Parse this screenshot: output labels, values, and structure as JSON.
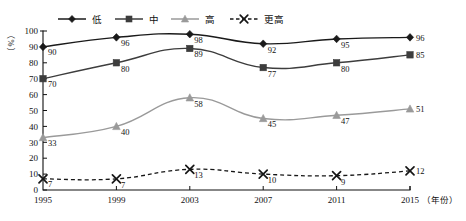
{
  "chart_data": {
    "type": "line",
    "title": "",
    "subtitle": "",
    "xlabel": "（年份）",
    "ylabel": "（%）",
    "x": [
      1995,
      1999,
      2003,
      2007,
      2011,
      2015
    ],
    "categories": [
      "1995",
      "1999",
      "2003",
      "2007",
      "2011",
      "2015"
    ],
    "xlim": [
      1995,
      2015
    ],
    "ylim": [
      0,
      100
    ],
    "yticks": [
      0,
      10,
      20,
      30,
      40,
      50,
      60,
      70,
      80,
      90,
      100
    ],
    "ytick_labels": [
      "0",
      "10",
      "20",
      "30",
      "40",
      "50",
      "60",
      "70",
      "80",
      "90",
      "100"
    ],
    "grid": false,
    "legend_position": "top-center",
    "series": [
      {
        "name": "低",
        "values": [
          90,
          96,
          98,
          92,
          95,
          96
        ],
        "color": "#1a1a1a",
        "marker": "diamond",
        "dash": "solid",
        "labels": [
          "90",
          "96",
          "98",
          "92",
          "95",
          "96"
        ]
      },
      {
        "name": "中",
        "values": [
          70,
          80,
          89,
          77,
          80,
          85
        ],
        "color": "#3d3d3d",
        "marker": "square",
        "dash": "solid",
        "labels": [
          "70",
          "80",
          "89",
          "77",
          "80",
          "85"
        ]
      },
      {
        "name": "高",
        "values": [
          33,
          40,
          58,
          45,
          47,
          51
        ],
        "color": "#9a9a9a",
        "marker": "triangle",
        "dash": "solid",
        "labels": [
          "33",
          "40",
          "58",
          "45",
          "47",
          "51"
        ]
      },
      {
        "name": "更高",
        "values": [
          7,
          7,
          13,
          10,
          9,
          12
        ],
        "color": "#161616",
        "marker": "cross",
        "dash": "dashed",
        "labels": [
          "7",
          "7",
          "13",
          "10",
          "9",
          "12"
        ]
      }
    ]
  },
  "legend": {
    "items": [
      {
        "label": "低"
      },
      {
        "label": "中"
      },
      {
        "label": "高"
      },
      {
        "label": "更高"
      }
    ]
  },
  "axes": {
    "y_unit_label": "（%）",
    "x_unit_label": "（年份）"
  }
}
